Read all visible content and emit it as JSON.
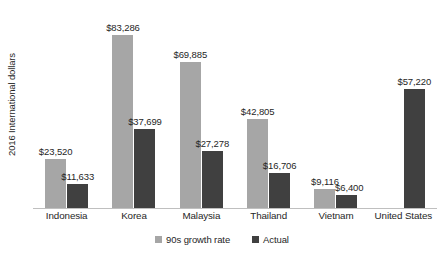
{
  "chart_data": {
    "type": "bar",
    "title": "",
    "subtitle": "",
    "xlabel": "",
    "ylabel": "2016 International dollars",
    "categories": [
      "Indonesia",
      "Korea",
      "Malaysia",
      "Thailand",
      "Vietnam",
      "United States"
    ],
    "series": [
      {
        "name": "90s growth rate",
        "color": "#a6a6a6",
        "values": [
          23520,
          83286,
          69885,
          42805,
          9116,
          null
        ],
        "labels": [
          "$23,520",
          "$83,286",
          "$69,885",
          "$42,805",
          "$9,116",
          ""
        ]
      },
      {
        "name": "Actual",
        "color": "#404040",
        "values": [
          11633,
          37699,
          27278,
          16706,
          6400,
          57220
        ],
        "labels": [
          "$11,633",
          "$37,699",
          "$27,278",
          "$16,706",
          "$6,400",
          "$57,220"
        ]
      }
    ],
    "ylim": [
      0,
      96000
    ],
    "grid": false,
    "axis_tick_labels": false,
    "legend_position": "bottom",
    "annotations": []
  },
  "legend": {
    "items": [
      {
        "label": "90s growth rate"
      },
      {
        "label": "Actual"
      }
    ]
  }
}
